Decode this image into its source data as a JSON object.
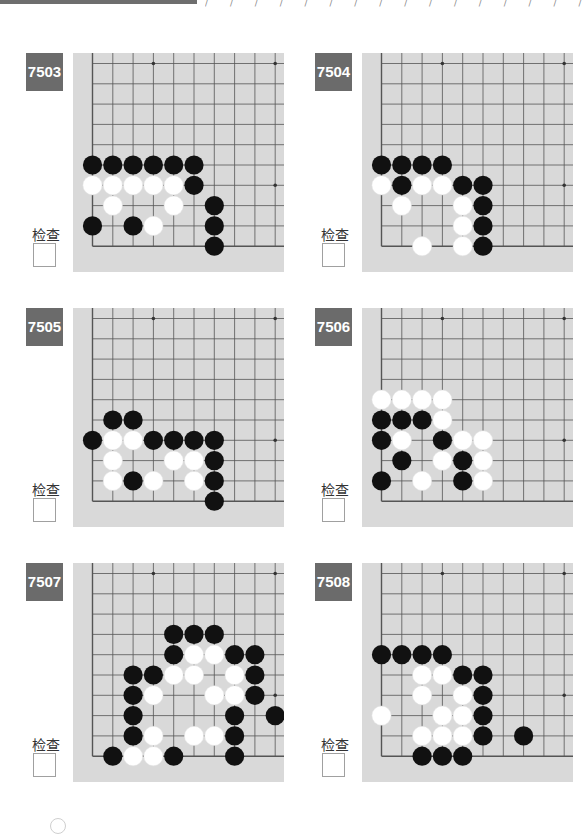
{
  "header": {
    "decoration": "/ / / / / / / / / / / / / / / / / / /",
    "bar_color": "#6e6e6e"
  },
  "colors": {
    "board_bg": "#d9d9d9",
    "grid_line": "#555555",
    "badge_bg": "#6b6b6b",
    "black_stone": "#111111",
    "white_stone": "#ffffff"
  },
  "check_label": "检查",
  "problems": [
    {
      "number": "7503",
      "black": [
        [
          0,
          5
        ],
        [
          1,
          5
        ],
        [
          2,
          5
        ],
        [
          3,
          5
        ],
        [
          4,
          5
        ],
        [
          5,
          5
        ],
        [
          5,
          6
        ],
        [
          6,
          7
        ],
        [
          0,
          8
        ],
        [
          2,
          8
        ],
        [
          6,
          8
        ],
        [
          6,
          9
        ]
      ],
      "white": [
        [
          0,
          6
        ],
        [
          1,
          6
        ],
        [
          2,
          6
        ],
        [
          3,
          6
        ],
        [
          4,
          6
        ],
        [
          1,
          7
        ],
        [
          4,
          7
        ],
        [
          3,
          8
        ]
      ]
    },
    {
      "number": "7504",
      "black": [
        [
          0,
          5
        ],
        [
          1,
          5
        ],
        [
          2,
          5
        ],
        [
          3,
          5
        ],
        [
          1,
          6
        ],
        [
          4,
          6
        ],
        [
          5,
          6
        ],
        [
          5,
          7
        ],
        [
          5,
          8
        ],
        [
          5,
          9
        ]
      ],
      "white": [
        [
          0,
          6
        ],
        [
          2,
          6
        ],
        [
          3,
          6
        ],
        [
          1,
          7
        ],
        [
          4,
          7
        ],
        [
          4,
          8
        ],
        [
          2,
          9
        ],
        [
          4,
          9
        ]
      ]
    },
    {
      "number": "7505",
      "black": [
        [
          1,
          5
        ],
        [
          2,
          5
        ],
        [
          0,
          6
        ],
        [
          3,
          6
        ],
        [
          4,
          6
        ],
        [
          5,
          6
        ],
        [
          6,
          6
        ],
        [
          6,
          7
        ],
        [
          2,
          8
        ],
        [
          6,
          8
        ],
        [
          6,
          9
        ]
      ],
      "white": [
        [
          1,
          6
        ],
        [
          2,
          6
        ],
        [
          1,
          7
        ],
        [
          4,
          7
        ],
        [
          5,
          7
        ],
        [
          1,
          8
        ],
        [
          3,
          8
        ],
        [
          5,
          8
        ]
      ]
    },
    {
      "number": "7506",
      "black": [
        [
          0,
          5
        ],
        [
          1,
          5
        ],
        [
          2,
          5
        ],
        [
          0,
          6
        ],
        [
          3,
          6
        ],
        [
          1,
          7
        ],
        [
          4,
          7
        ],
        [
          0,
          8
        ],
        [
          4,
          8
        ]
      ],
      "white": [
        [
          0,
          4
        ],
        [
          1,
          4
        ],
        [
          2,
          4
        ],
        [
          3,
          4
        ],
        [
          3,
          5
        ],
        [
          1,
          6
        ],
        [
          4,
          6
        ],
        [
          5,
          6
        ],
        [
          3,
          7
        ],
        [
          5,
          7
        ],
        [
          2,
          8
        ],
        [
          5,
          8
        ]
      ]
    },
    {
      "number": "7507",
      "black": [
        [
          4,
          3
        ],
        [
          5,
          3
        ],
        [
          6,
          3
        ],
        [
          4,
          4
        ],
        [
          7,
          4
        ],
        [
          8,
          4
        ],
        [
          2,
          5
        ],
        [
          3,
          5
        ],
        [
          8,
          5
        ],
        [
          2,
          6
        ],
        [
          8,
          6
        ],
        [
          2,
          7
        ],
        [
          7,
          7
        ],
        [
          9,
          7
        ],
        [
          2,
          8
        ],
        [
          7,
          8
        ],
        [
          1,
          9
        ],
        [
          4,
          9
        ],
        [
          7,
          9
        ]
      ],
      "white": [
        [
          5,
          4
        ],
        [
          6,
          4
        ],
        [
          4,
          5
        ],
        [
          5,
          5
        ],
        [
          7,
          5
        ],
        [
          3,
          6
        ],
        [
          6,
          6
        ],
        [
          7,
          6
        ],
        [
          3,
          8
        ],
        [
          5,
          8
        ],
        [
          6,
          8
        ],
        [
          2,
          9
        ],
        [
          3,
          9
        ]
      ]
    },
    {
      "number": "7508",
      "black": [
        [
          0,
          4
        ],
        [
          1,
          4
        ],
        [
          2,
          4
        ],
        [
          3,
          4
        ],
        [
          4,
          5
        ],
        [
          5,
          5
        ],
        [
          5,
          6
        ],
        [
          5,
          7
        ],
        [
          5,
          8
        ],
        [
          7,
          8
        ],
        [
          2,
          9
        ],
        [
          3,
          9
        ],
        [
          4,
          9
        ]
      ],
      "white": [
        [
          2,
          5
        ],
        [
          3,
          5
        ],
        [
          2,
          6
        ],
        [
          4,
          6
        ],
        [
          0,
          7
        ],
        [
          3,
          7
        ],
        [
          4,
          7
        ],
        [
          2,
          8
        ],
        [
          3,
          8
        ],
        [
          4,
          8
        ]
      ]
    }
  ]
}
